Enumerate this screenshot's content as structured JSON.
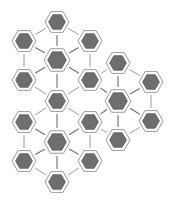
{
  "figure": {
    "width": 175,
    "height": 202,
    "background_color": "#ffffff"
  },
  "style": {
    "node_fill_color": "#6e6e6e",
    "node_inner_stroke_color": "#5c5c5c",
    "node_outer_fill_color": "#ffffff",
    "node_outer_stroke_color": "#9a9a9a",
    "edge_color": "#8e8e8e",
    "spoke_color": "#6f6f6f",
    "node_orientation": "flat-top-hexagon"
  },
  "chart_data": {
    "type": "diagram",
    "layout": "hexagonal-flower-lattice",
    "node_count": 21,
    "edge_count": 30,
    "cluster_count": 3,
    "clusters": [
      {
        "id": "cluster-top-left",
        "hub": "n-h1",
        "hub_x": 57,
        "hub_y": 60
      },
      {
        "id": "cluster-bottom-left",
        "hub": "n-h2",
        "hub_x": 57,
        "hub_y": 142
      },
      {
        "id": "cluster-right",
        "hub": "n-h3",
        "hub_x": 118,
        "hub_y": 101
      }
    ],
    "nodes": [
      {
        "id": "n-h1",
        "label": "hub-1",
        "x": 57,
        "y": 60,
        "role": "hub",
        "radius": 13
      },
      {
        "id": "n-h2",
        "label": "hub-2",
        "x": 57,
        "y": 142,
        "role": "hub",
        "radius": 13
      },
      {
        "id": "n-h3",
        "label": "hub-3",
        "x": 118,
        "y": 101,
        "role": "hub",
        "radius": 13
      },
      {
        "id": "n-01",
        "label": "node-1",
        "x": 57,
        "y": 22,
        "role": "satellite",
        "radius": 12
      },
      {
        "id": "n-02",
        "label": "node-2",
        "x": 24,
        "y": 41,
        "role": "satellite",
        "radius": 12
      },
      {
        "id": "n-03",
        "label": "node-3",
        "x": 90,
        "y": 41,
        "role": "satellite",
        "radius": 12
      },
      {
        "id": "n-04",
        "label": "node-4",
        "x": 24,
        "y": 80,
        "role": "satellite",
        "radius": 12
      },
      {
        "id": "n-05",
        "label": "node-5",
        "x": 90,
        "y": 80,
        "role": "satellite",
        "radius": 12
      },
      {
        "id": "n-06",
        "label": "node-6",
        "x": 57,
        "y": 101,
        "role": "satellite",
        "radius": 12
      },
      {
        "id": "n-07",
        "label": "node-7",
        "x": 24,
        "y": 122,
        "role": "satellite",
        "radius": 12
      },
      {
        "id": "n-08",
        "label": "node-8",
        "x": 90,
        "y": 122,
        "role": "satellite",
        "radius": 12
      },
      {
        "id": "n-09",
        "label": "node-9",
        "x": 24,
        "y": 161,
        "role": "satellite",
        "radius": 12
      },
      {
        "id": "n-10",
        "label": "node-10",
        "x": 90,
        "y": 161,
        "role": "satellite",
        "radius": 12
      },
      {
        "id": "n-11",
        "label": "node-11",
        "x": 57,
        "y": 182,
        "role": "satellite",
        "radius": 12
      },
      {
        "id": "n-12",
        "label": "node-12",
        "x": 118,
        "y": 63,
        "role": "satellite",
        "radius": 12
      },
      {
        "id": "n-13",
        "label": "node-13",
        "x": 151,
        "y": 82,
        "role": "satellite",
        "radius": 12
      },
      {
        "id": "n-14",
        "label": "node-14",
        "x": 151,
        "y": 121,
        "role": "satellite",
        "radius": 12
      },
      {
        "id": "n-15",
        "label": "node-15",
        "x": 118,
        "y": 140,
        "role": "satellite",
        "radius": 12
      }
    ],
    "edges": [
      {
        "from": "n-h1",
        "to": "n-01",
        "kind": "spoke"
      },
      {
        "from": "n-h1",
        "to": "n-02",
        "kind": "spoke"
      },
      {
        "from": "n-h1",
        "to": "n-03",
        "kind": "spoke"
      },
      {
        "from": "n-h1",
        "to": "n-04",
        "kind": "spoke"
      },
      {
        "from": "n-h1",
        "to": "n-05",
        "kind": "spoke"
      },
      {
        "from": "n-h1",
        "to": "n-06",
        "kind": "spoke"
      },
      {
        "from": "n-h2",
        "to": "n-06",
        "kind": "spoke"
      },
      {
        "from": "n-h2",
        "to": "n-07",
        "kind": "spoke"
      },
      {
        "from": "n-h2",
        "to": "n-08",
        "kind": "spoke"
      },
      {
        "from": "n-h2",
        "to": "n-09",
        "kind": "spoke"
      },
      {
        "from": "n-h2",
        "to": "n-10",
        "kind": "spoke"
      },
      {
        "from": "n-h2",
        "to": "n-11",
        "kind": "spoke"
      },
      {
        "from": "n-h3",
        "to": "n-12",
        "kind": "spoke"
      },
      {
        "from": "n-h3",
        "to": "n-13",
        "kind": "spoke"
      },
      {
        "from": "n-h3",
        "to": "n-14",
        "kind": "spoke"
      },
      {
        "from": "n-h3",
        "to": "n-15",
        "kind": "spoke"
      },
      {
        "from": "n-h3",
        "to": "n-05",
        "kind": "spoke"
      },
      {
        "from": "n-h3",
        "to": "n-08",
        "kind": "spoke"
      },
      {
        "from": "n-01",
        "to": "n-02",
        "kind": "rim"
      },
      {
        "from": "n-01",
        "to": "n-03",
        "kind": "rim"
      },
      {
        "from": "n-02",
        "to": "n-04",
        "kind": "rim"
      },
      {
        "from": "n-03",
        "to": "n-05",
        "kind": "rim"
      },
      {
        "from": "n-04",
        "to": "n-06",
        "kind": "rim"
      },
      {
        "from": "n-05",
        "to": "n-06",
        "kind": "rim"
      },
      {
        "from": "n-06",
        "to": "n-07",
        "kind": "rim"
      },
      {
        "from": "n-06",
        "to": "n-08",
        "kind": "rim"
      },
      {
        "from": "n-07",
        "to": "n-09",
        "kind": "rim"
      },
      {
        "from": "n-08",
        "to": "n-10",
        "kind": "rim"
      },
      {
        "from": "n-09",
        "to": "n-11",
        "kind": "rim"
      },
      {
        "from": "n-10",
        "to": "n-11",
        "kind": "rim"
      },
      {
        "from": "n-12",
        "to": "n-13",
        "kind": "rim"
      },
      {
        "from": "n-13",
        "to": "n-14",
        "kind": "rim"
      },
      {
        "from": "n-14",
        "to": "n-15",
        "kind": "rim"
      },
      {
        "from": "n-05",
        "to": "n-12",
        "kind": "rim"
      },
      {
        "from": "n-08",
        "to": "n-15",
        "kind": "rim"
      }
    ]
  }
}
